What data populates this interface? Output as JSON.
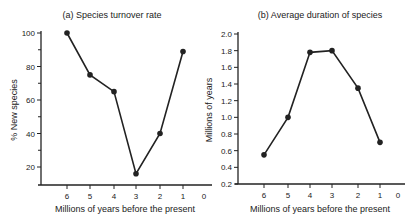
{
  "chart_data": [
    {
      "type": "line",
      "title": "(a) Species turnover rate",
      "xlabel": "Millions of years before the present",
      "ylabel": "% New species",
      "x_ticks": [
        "6",
        "5",
        "4",
        "3",
        "2",
        "1",
        "0"
      ],
      "y_ticks": [
        "100",
        "80",
        "60",
        "40",
        "20"
      ],
      "ylim": [
        9,
        100
      ],
      "xlim": [
        7,
        0
      ],
      "grid": false,
      "x": [
        6,
        5,
        4,
        3,
        2,
        1
      ],
      "values": [
        100,
        75,
        65,
        16,
        40,
        89
      ]
    },
    {
      "type": "line",
      "title": "(b) Average duration of species",
      "xlabel": "Millions of years before the present",
      "ylabel": "Millions of years",
      "x_ticks": [
        "6",
        "5",
        "4",
        "3",
        "2",
        "1",
        "0"
      ],
      "y_ticks": [
        "2.0",
        "1.8",
        "1.6",
        "1.4",
        "1.2",
        "1.0",
        "0.8",
        "0.6",
        "0.4",
        "0.2"
      ],
      "ylim": [
        0.2,
        2.0
      ],
      "xlim": [
        7,
        0
      ],
      "grid": false,
      "x": [
        6,
        5,
        4,
        3,
        2,
        1
      ],
      "values": [
        0.55,
        1.0,
        1.78,
        1.8,
        1.35,
        0.7
      ]
    }
  ],
  "colors": {
    "ink": "#222222",
    "background": "#ffffff"
  }
}
